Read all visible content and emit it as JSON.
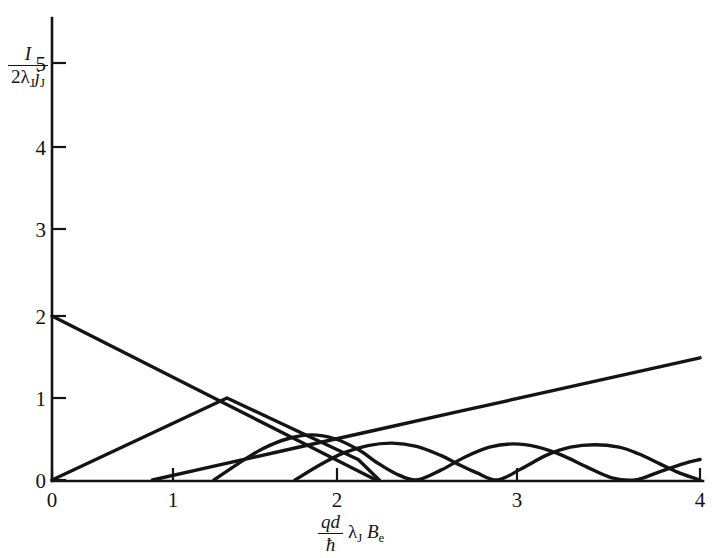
{
  "figure": {
    "title": "",
    "background_color": "#ffffff",
    "ink_color": "#141414"
  },
  "axes": {
    "y_label": {
      "numerator": "I",
      "denominator_prefix": "2",
      "denominator_lambda": "λ",
      "denominator_lambda_sub": "J",
      "denominator_j": "j",
      "denominator_j_sub": "J",
      "plain": "I / (2λ_J j_J)"
    },
    "x_label": {
      "numerator": "qd",
      "denominator": "ħ",
      "lambda": "λ",
      "lambda_sub": "J",
      "b": "B",
      "b_sub": "e",
      "plain": "(qd/ħ) λ_J B_e"
    },
    "x_ticks": [
      "0",
      "1",
      "2",
      "3",
      "4"
    ],
    "y_ticks": [
      "0",
      "1",
      "2",
      "3",
      "4",
      "5"
    ],
    "x_range": [
      0,
      4
    ],
    "y_range": [
      0,
      5.35
    ],
    "grid": false,
    "legend": "none"
  },
  "chart_data": {
    "type": "line",
    "title": "",
    "xlabel": "(qd/ħ) λ_J B_e",
    "ylabel": "I / (2λ_J j_J)",
    "xlim": [
      0,
      4
    ],
    "ylim": [
      0,
      5.35
    ],
    "xticks": [
      0,
      1,
      2,
      3,
      4
    ],
    "yticks": [
      0,
      1,
      2,
      3,
      4,
      5
    ],
    "grid": false,
    "legend_position": "none",
    "series": [
      {
        "name": "branch-1-descending-line",
        "style": "straight-line",
        "x": [
          0.0,
          0.25,
          0.5,
          0.75,
          1.0,
          1.25,
          1.5,
          1.75,
          2.0
        ],
        "y": [
          2.0,
          1.75,
          1.5,
          1.25,
          1.0,
          0.75,
          0.5,
          0.25,
          0.0
        ]
      },
      {
        "name": "branch-2-triangular",
        "style": "straight-line",
        "x": [
          0.0,
          0.27,
          0.54,
          0.81,
          1.08,
          1.35,
          1.62,
          1.89,
          2.02
        ],
        "y": [
          0.0,
          0.25,
          0.5,
          0.75,
          1.0,
          0.75,
          0.5,
          0.25,
          0.0
        ]
      },
      {
        "name": "branch-3-rising-line",
        "style": "straight-line",
        "x": [
          0.62,
          1.0,
          1.5,
          2.0,
          2.5,
          3.0,
          3.5,
          4.0
        ],
        "y": [
          0.0,
          0.17,
          0.39,
          0.61,
          0.83,
          1.05,
          1.27,
          1.49
        ]
      },
      {
        "name": "lobe-curve-a",
        "style": "oscillating-lobes",
        "x": [
          1.0,
          1.15,
          1.3,
          1.45,
          1.6,
          1.75,
          1.9,
          2.0,
          2.12,
          2.25,
          2.4,
          2.55,
          2.7,
          2.85,
          3.0,
          3.15,
          3.3,
          3.45,
          3.6,
          3.75,
          3.9,
          4.0
        ],
        "y": [
          0.0,
          0.2,
          0.38,
          0.5,
          0.55,
          0.5,
          0.36,
          0.22,
          0.08,
          0.0,
          0.12,
          0.28,
          0.4,
          0.44,
          0.4,
          0.3,
          0.16,
          0.03,
          0.0,
          0.1,
          0.2,
          0.25
        ]
      },
      {
        "name": "lobe-curve-b",
        "style": "oscillating-lobes",
        "x": [
          1.5,
          1.65,
          1.8,
          1.95,
          2.1,
          2.25,
          2.4,
          2.5,
          2.62,
          2.75,
          2.9,
          3.05,
          3.2,
          3.35,
          3.5,
          3.62,
          3.75,
          3.88,
          4.0
        ],
        "y": [
          0.0,
          0.18,
          0.33,
          0.42,
          0.45,
          0.41,
          0.3,
          0.2,
          0.09,
          0.0,
          0.14,
          0.3,
          0.4,
          0.43,
          0.4,
          0.32,
          0.2,
          0.08,
          0.0
        ]
      }
    ],
    "annotations": [
      {
        "text": "peak of triangular branch",
        "x": 1.08,
        "y": 1.0
      },
      {
        "text": "y-intercept of descending line",
        "x": 0.0,
        "y": 2.0
      },
      {
        "text": "zero crossing of descending line",
        "x": 2.0,
        "y": 0.0
      }
    ]
  }
}
